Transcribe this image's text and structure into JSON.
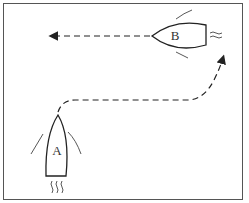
{
  "diagram": {
    "type": "boat-overtaking-maneuver",
    "boats": [
      {
        "label": "A",
        "heading": "north",
        "position": "bottom-left"
      },
      {
        "label": "B",
        "heading": "west",
        "position": "top-right"
      }
    ],
    "paths": [
      {
        "from": "A",
        "description": "dashed path curving right then up to the right edge near B"
      },
      {
        "from": "B",
        "description": "dashed arrow heading left"
      }
    ],
    "colors": {
      "stroke": "#222222",
      "background": "#ffffff",
      "border": "#555555"
    }
  }
}
